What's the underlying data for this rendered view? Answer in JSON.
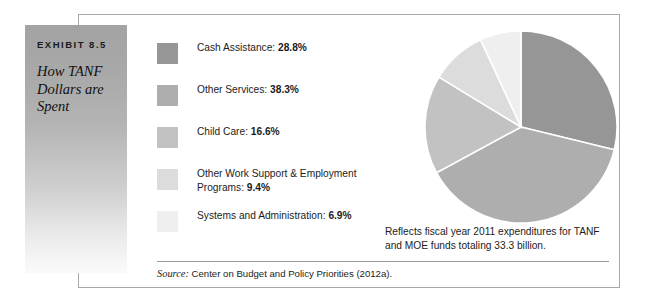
{
  "exhibit": {
    "label": "EXHIBIT 8.5",
    "title": "How TANF Dollars are Spent"
  },
  "note": "Reflects fiscal year 2011 expenditures for TANF and MOE funds totaling 33.3 billion.",
  "source": {
    "prefix": "Source:",
    "text": "Center on Budget and Policy Priorities (2012a)."
  },
  "legend": [
    {
      "label": "Cash Assistance:",
      "value": "28.8%",
      "color": "#969696"
    },
    {
      "label": "Other Services:",
      "value": "38.3%",
      "color": "#aeaeae"
    },
    {
      "label": "Child Care:",
      "value": "16.6%",
      "color": "#c2c2c2"
    },
    {
      "label": "Other Work Support & Employment Programs:",
      "value": "9.4%",
      "color": "#dcdcdc"
    },
    {
      "label": "Systems and Administration:",
      "value": "6.9%",
      "color": "#efefef"
    }
  ],
  "chart_data": {
    "type": "pie",
    "title": "How TANF Dollars are Spent",
    "labels": [
      "Cash Assistance",
      "Other Services",
      "Child Care",
      "Other Work Support & Employment Programs",
      "Systems and Administration"
    ],
    "values": [
      28.8,
      38.3,
      16.6,
      9.4,
      6.9
    ],
    "unit": "percent",
    "colors": [
      "#969696",
      "#aeaeae",
      "#c2c2c2",
      "#dcdcdc",
      "#efefef"
    ],
    "start_angle_deg": 0,
    "direction": "clockwise",
    "legend_position": "left",
    "annotation": "Reflects fiscal year 2011 expenditures for TANF and MOE funds totaling 33.3 billion.",
    "source": "Center on Budget and Policy Priorities (2012a)."
  }
}
